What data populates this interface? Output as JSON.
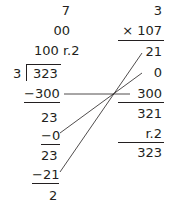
{
  "division": {
    "rows": [
      {
        "text": "7",
        "top": 3
      },
      {
        "text": "00",
        "top": 23
      },
      {
        "text": "100 r.2",
        "top": 43
      }
    ],
    "divisor": "3",
    "dividend": "323",
    "steps": [
      {
        "text": "−300",
        "top": 87,
        "underline": true
      },
      {
        "text": "23",
        "top": 110,
        "underline": false
      },
      {
        "text": "−0",
        "top": 128,
        "underline": true
      },
      {
        "text": "23",
        "top": 148,
        "underline": false
      },
      {
        "text": "−21",
        "top": 167,
        "underline": true
      },
      {
        "text": "2",
        "top": 188,
        "underline": false
      }
    ]
  },
  "multiplication": {
    "multiplicand": "3",
    "multiplier": "× 107",
    "partials": [
      "21",
      "0",
      "300"
    ],
    "sum": "321",
    "remainder": "r.2",
    "total": "323"
  },
  "colors": {
    "ink": "#231f20",
    "background": "#ffffff"
  }
}
